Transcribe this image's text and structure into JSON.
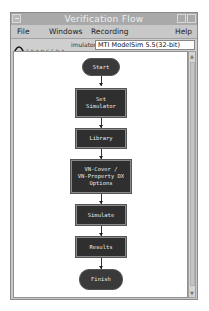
{
  "window": {
    "title": "Verification Flow"
  },
  "menubar": {
    "items": [
      "File",
      "Windows",
      "Recording",
      "Help"
    ]
  },
  "toolbar": {
    "logo_text": "TRANSEDA",
    "simulator_label": "imulator",
    "simulator_value": "MTI ModelSim 5.5(32-bit)"
  },
  "flow": {
    "nodes": [
      {
        "id": "start",
        "label": "Start",
        "shape": "terminal"
      },
      {
        "id": "set-simulator",
        "label": "Set\nSimulator",
        "shape": "process"
      },
      {
        "id": "library",
        "label": "Library",
        "shape": "process"
      },
      {
        "id": "vm-cover",
        "label": "VN-Cover /\nVN-Property DX\nOptions",
        "shape": "process"
      },
      {
        "id": "simulate",
        "label": "Simulate",
        "shape": "process"
      },
      {
        "id": "results",
        "label": "Results",
        "shape": "process"
      },
      {
        "id": "finish",
        "label": "Finish",
        "shape": "terminal"
      }
    ]
  },
  "colors": {
    "node_fill": "#333333",
    "node_text": "#e8e8e8",
    "window_bg": "#c8c8c8",
    "titlebar_bg": "#a9a9a9"
  }
}
